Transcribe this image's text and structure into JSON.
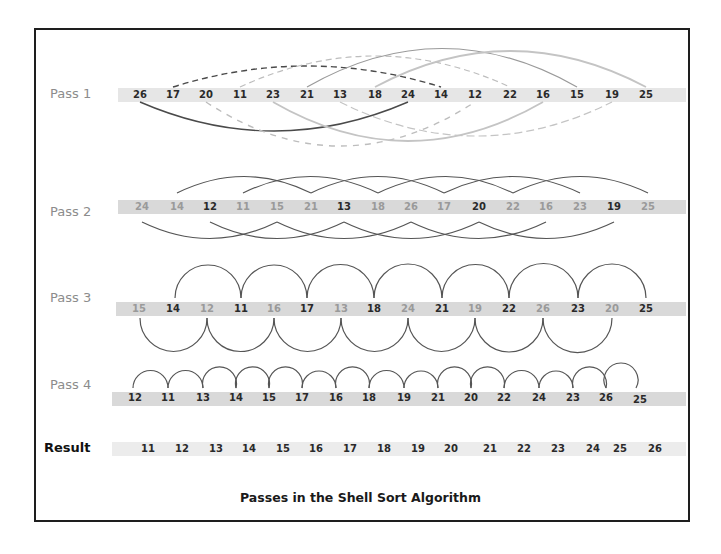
{
  "caption": "Passes in the Shell Sort Algorithm",
  "colors": {
    "frame": "#1e1e1e",
    "strip": "#d9d9d9",
    "arc_dark": "#4a4a4a",
    "arc_light": "#bdbdbd",
    "label": "#8c8c8c"
  },
  "rows": [
    {
      "label": "Pass 1",
      "gap": 8,
      "values": [
        26,
        17,
        20,
        11,
        23,
        21,
        13,
        18,
        24,
        14,
        12,
        22,
        16,
        15,
        19,
        25
      ],
      "pairs": [
        [
          "26",
          "24"
        ],
        [
          "17",
          "14"
        ],
        [
          "20",
          "12"
        ],
        [
          "11",
          "22"
        ],
        [
          "23",
          "16"
        ],
        [
          "21",
          "15"
        ],
        [
          "13",
          "19"
        ],
        [
          "18",
          "25"
        ]
      ]
    },
    {
      "label": "Pass 2",
      "gap": 4,
      "values": [
        24,
        14,
        12,
        11,
        15,
        21,
        13,
        18,
        26,
        17,
        20,
        22,
        16,
        23,
        19,
        25
      ]
    },
    {
      "label": "Pass 3",
      "gap": 2,
      "values": [
        15,
        14,
        12,
        11,
        16,
        17,
        13,
        18,
        24,
        21,
        19,
        22,
        26,
        23,
        20,
        25
      ]
    },
    {
      "label": "Pass 4",
      "gap": 1,
      "values": [
        12,
        11,
        13,
        14,
        15,
        17,
        16,
        18,
        19,
        21,
        20,
        22,
        24,
        23,
        26,
        25
      ]
    },
    {
      "label": "Result",
      "values": [
        11,
        12,
        13,
        14,
        15,
        16,
        17,
        18,
        19,
        20,
        21,
        22,
        23,
        24,
        25,
        26
      ]
    }
  ]
}
